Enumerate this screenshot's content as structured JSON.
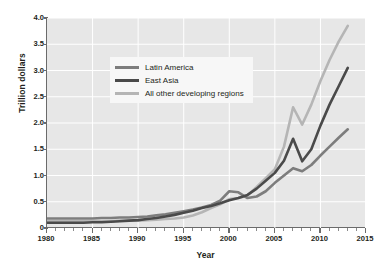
{
  "chart_data": {
    "type": "line",
    "title": "",
    "xlabel": "Year",
    "ylabel": "Trillion dollars",
    "xlim": [
      1980,
      2015
    ],
    "ylim": [
      0,
      4.0
    ],
    "grid": true,
    "legend_position": "top-left",
    "x_ticks": [
      1980,
      1985,
      1990,
      1995,
      2000,
      2005,
      2010,
      2015
    ],
    "x_tick_labels": [
      "1980",
      "1985",
      "1990",
      "1995",
      "2000",
      "2005",
      "2010",
      "2015"
    ],
    "x_minor_tick_step": 1,
    "y_ticks": [
      0,
      0.5,
      1.0,
      1.5,
      2.0,
      2.5,
      3.0,
      3.5,
      4.0
    ],
    "y_tick_labels": [
      "0",
      "0.5",
      "1.0",
      "1.5",
      "2.0",
      "2.5",
      "3.0",
      "3.5",
      "4.0"
    ],
    "x": [
      1980,
      1981,
      1982,
      1983,
      1984,
      1985,
      1986,
      1987,
      1988,
      1989,
      1990,
      1991,
      1992,
      1993,
      1994,
      1995,
      1996,
      1997,
      1998,
      1999,
      2000,
      2001,
      2002,
      2003,
      2004,
      2005,
      2006,
      2007,
      2008,
      2009,
      2010,
      2011,
      2012,
      2013
    ],
    "series": [
      {
        "name": "Latin America",
        "color": "#7d7d7d",
        "values": [
          0.18,
          0.18,
          0.18,
          0.18,
          0.18,
          0.18,
          0.19,
          0.19,
          0.2,
          0.2,
          0.21,
          0.22,
          0.24,
          0.26,
          0.29,
          0.32,
          0.35,
          0.39,
          0.44,
          0.52,
          0.7,
          0.68,
          0.57,
          0.6,
          0.7,
          0.86,
          1.0,
          1.14,
          1.08,
          1.2,
          1.38,
          1.55,
          1.72,
          1.88
        ]
      },
      {
        "name": "East Asia",
        "color": "#4a4a4a",
        "values": [
          0.1,
          0.1,
          0.1,
          0.1,
          0.1,
          0.11,
          0.11,
          0.12,
          0.13,
          0.14,
          0.15,
          0.17,
          0.19,
          0.22,
          0.25,
          0.29,
          0.33,
          0.38,
          0.42,
          0.47,
          0.53,
          0.57,
          0.63,
          0.75,
          0.9,
          1.05,
          1.28,
          1.7,
          1.27,
          1.5,
          1.95,
          2.35,
          2.7,
          3.05
        ]
      },
      {
        "name": "All other developing regions",
        "color": "#b5b5b5",
        "values": [
          0.13,
          0.13,
          0.13,
          0.13,
          0.13,
          0.13,
          0.13,
          0.13,
          0.14,
          0.14,
          0.14,
          0.15,
          0.16,
          0.17,
          0.18,
          0.2,
          0.24,
          0.3,
          0.38,
          0.45,
          0.55,
          0.57,
          0.62,
          0.78,
          0.95,
          1.12,
          1.55,
          2.3,
          1.97,
          2.35,
          2.8,
          3.2,
          3.55,
          3.85
        ]
      }
    ]
  },
  "legend": {
    "items": [
      {
        "label": "Latin America"
      },
      {
        "label": "East Asia"
      },
      {
        "label": "All other developing regions"
      }
    ]
  },
  "axes": {
    "y_label": "Trillion dollars",
    "x_label": "Year"
  }
}
